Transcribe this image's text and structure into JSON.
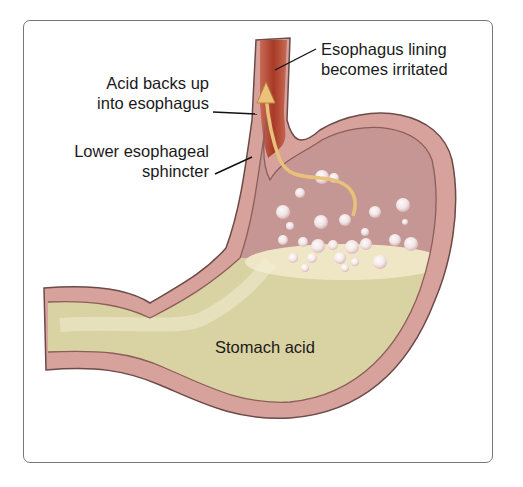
{
  "figure": {
    "labels": {
      "esophagus_lining_line1": "Esophagus lining",
      "esophagus_lining_line2": "becomes irritated",
      "acid_backs_up_line1": "Acid backs up",
      "acid_backs_up_line2": "into  esophagus",
      "sphincter_line1": "Lower esophageal",
      "sphincter_line2": "sphincter",
      "stomach_acid": "Stomach acid"
    },
    "colors": {
      "esophagus": "#b5452f",
      "stomach_wall": "#d9a5a0",
      "stomach_interior": "#c99c9a",
      "acid": "#ddd6a8",
      "foam": "#efe6c8",
      "arrow": "#e8c27a",
      "frame_border": "#777777"
    }
  }
}
